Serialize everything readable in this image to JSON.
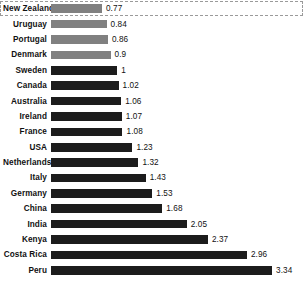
{
  "chart_data": {
    "type": "bar",
    "orientation": "horizontal",
    "title": "",
    "subtitle": "",
    "xlabel": "",
    "ylabel": "",
    "grid": false,
    "legend": false,
    "axis_visible": false,
    "xlim": [
      0,
      3.34
    ],
    "categories": [
      "New Zealand",
      "Uruguay",
      "Portugal",
      "Denmark",
      "Sweden",
      "Canada",
      "Australia",
      "Ireland",
      "France",
      "USA",
      "Netherlands",
      "Italy",
      "Germany",
      "China",
      "India",
      "Kenya",
      "Costa Rica",
      "Peru"
    ],
    "values": [
      0.77,
      0.84,
      0.86,
      0.9,
      1,
      1.02,
      1.06,
      1.07,
      1.08,
      1.23,
      1.32,
      1.43,
      1.53,
      1.68,
      2.05,
      2.37,
      2.96,
      3.34
    ],
    "value_labels": [
      "0.77",
      "0.84",
      "0.86",
      "0.9",
      "1",
      "1.02",
      "1.06",
      "1.07",
      "1.08",
      "1.23",
      "1.32",
      "1.43",
      "1.53",
      "1.68",
      "2.05",
      "2.37",
      "2.96",
      "3.34"
    ],
    "bar_shades": [
      "light",
      "light",
      "light",
      "light",
      "dark",
      "dark",
      "dark",
      "dark",
      "dark",
      "dark",
      "dark",
      "dark",
      "dark",
      "dark",
      "dark",
      "dark",
      "dark",
      "dark"
    ],
    "highlighted_category": "New Zealand",
    "colors": {
      "dark_bar": "#1c1c1c",
      "light_bar": "#808080",
      "text": "#111111",
      "highlight_border": "#9a9a9a",
      "background": "#ffffff"
    }
  },
  "rows": [
    {
      "label": "New Zealand",
      "value": "0.77",
      "num": 0.77,
      "shade": "light",
      "highlight": true
    },
    {
      "label": "Uruguay",
      "value": "0.84",
      "num": 0.84,
      "shade": "light",
      "highlight": false
    },
    {
      "label": "Portugal",
      "value": "0.86",
      "num": 0.86,
      "shade": "light",
      "highlight": false
    },
    {
      "label": "Denmark",
      "value": "0.9",
      "num": 0.9,
      "shade": "light",
      "highlight": false
    },
    {
      "label": "Sweden",
      "value": "1",
      "num": 1,
      "shade": "dark",
      "highlight": false
    },
    {
      "label": "Canada",
      "value": "1.02",
      "num": 1.02,
      "shade": "dark",
      "highlight": false
    },
    {
      "label": "Australia",
      "value": "1.06",
      "num": 1.06,
      "shade": "dark",
      "highlight": false
    },
    {
      "label": "Ireland",
      "value": "1.07",
      "num": 1.07,
      "shade": "dark",
      "highlight": false
    },
    {
      "label": "France",
      "value": "1.08",
      "num": 1.08,
      "shade": "dark",
      "highlight": false
    },
    {
      "label": "USA",
      "value": "1.23",
      "num": 1.23,
      "shade": "dark",
      "highlight": false
    },
    {
      "label": "Netherlands",
      "value": "1.32",
      "num": 1.32,
      "shade": "dark",
      "highlight": false
    },
    {
      "label": "Italy",
      "value": "1.43",
      "num": 1.43,
      "shade": "dark",
      "highlight": false
    },
    {
      "label": "Germany",
      "value": "1.53",
      "num": 1.53,
      "shade": "dark",
      "highlight": false
    },
    {
      "label": "China",
      "value": "1.68",
      "num": 1.68,
      "shade": "dark",
      "highlight": false
    },
    {
      "label": "India",
      "value": "2.05",
      "num": 2.05,
      "shade": "dark",
      "highlight": false
    },
    {
      "label": "Kenya",
      "value": "2.37",
      "num": 2.37,
      "shade": "dark",
      "highlight": false
    },
    {
      "label": "Costa Rica",
      "value": "2.96",
      "num": 2.96,
      "shade": "dark",
      "highlight": false
    },
    {
      "label": "Peru",
      "value": "3.34",
      "num": 3.34,
      "shade": "dark",
      "highlight": false
    }
  ]
}
